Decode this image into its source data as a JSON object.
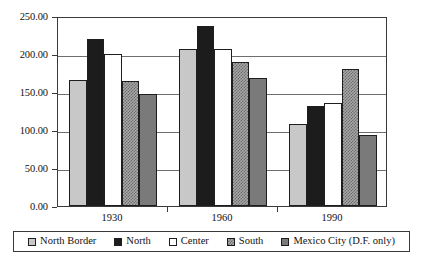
{
  "chart_data": {
    "type": "bar",
    "title": "",
    "xlabel": "",
    "ylabel": "",
    "categories": [
      "1930",
      "1960",
      "1990"
    ],
    "series": [
      {
        "name": "North Border",
        "swatch": "north-border",
        "color": "#c8c8c8",
        "values": [
          166.0,
          206.0,
          108.0
        ]
      },
      {
        "name": "North",
        "swatch": "north",
        "color": "#1c1c1c",
        "values": [
          220.0,
          237.0,
          131.0
        ]
      },
      {
        "name": "Center",
        "swatch": "center",
        "color": "#ffffff",
        "values": [
          200.0,
          206.0,
          136.0
        ]
      },
      {
        "name": "South",
        "swatch": "south",
        "color": "#a8a8a8",
        "values": [
          164.0,
          190.0,
          180.0
        ]
      },
      {
        "name": "Mexico City  (D.F. only)",
        "swatch": "mexico-city",
        "color": "#7a7a7a",
        "values": [
          148.0,
          169.0,
          94.0
        ]
      }
    ],
    "ylim": [
      0.0,
      250.0
    ],
    "yticks": [
      0.0,
      50.0,
      100.0,
      150.0,
      200.0,
      250.0
    ],
    "ytick_labels": [
      "0.00",
      "50.00",
      "100.00",
      "150.00",
      "200.00",
      "250.00"
    ],
    "grid": true,
    "legend_position": "bottom"
  }
}
